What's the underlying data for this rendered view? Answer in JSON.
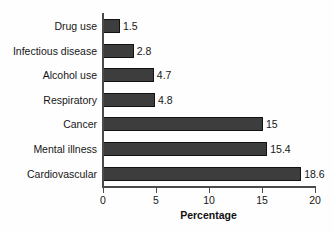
{
  "chart_data": {
    "type": "bar",
    "orientation": "horizontal",
    "title": "",
    "subtitle": "",
    "xlabel": "Percentage",
    "ylabel": "",
    "categories": [
      "Drug use",
      "Infectious disease",
      "Alcohol use",
      "Respiratory",
      "Cancer",
      "Mental illness",
      "Cardiovascular"
    ],
    "values": [
      1.5,
      2.8,
      4.7,
      4.8,
      15,
      15.4,
      18.6
    ],
    "value_labels": [
      "1.5",
      "2.8",
      "4.7",
      "4.8",
      "15",
      "15.4",
      "18.6"
    ],
    "xlim": [
      0,
      20
    ],
    "xticks": [
      0,
      5,
      10,
      15,
      20
    ],
    "xtick_labels": [
      "0",
      "5",
      "10",
      "15",
      "20"
    ],
    "grid": false,
    "legend": false,
    "legend_position": "none",
    "bar_color": "#3d3d3d",
    "bar_edge_color": "#121212",
    "axis_color": "#4b4b4b",
    "background_color": "#fefefe",
    "text_color": "#161616"
  }
}
